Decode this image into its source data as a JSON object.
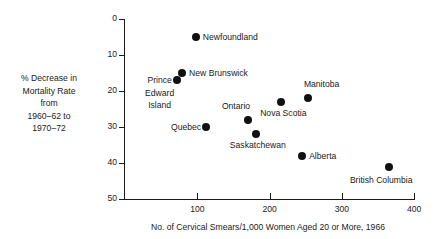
{
  "chart_data": {
    "type": "scatter",
    "title": "",
    "xlabel": "No. of Cervical Smears/1,000 Women Aged 20 or More, 1966",
    "ylabel": "% Decrease in\nMortality Rate\nfrom\n1960–62 to\n1970–72",
    "xlim": [
      0,
      400
    ],
    "ylim": [
      0,
      50
    ],
    "y_inverted": true,
    "grid": false,
    "legend": "none",
    "x_ticks": [
      100,
      200,
      300,
      400
    ],
    "y_ticks": [
      0,
      10,
      20,
      30,
      40,
      50
    ],
    "points": [
      {
        "label": "Newfoundland",
        "x": 98,
        "y": 5,
        "label_pos": "right"
      },
      {
        "label": "New Brunswick",
        "x": 79,
        "y": 15,
        "label_pos": "right"
      },
      {
        "label": "Prince\nEdward\nIsland",
        "x": 72,
        "y": 17,
        "label_pos": "left-below"
      },
      {
        "label": "Quebec",
        "x": 112,
        "y": 30,
        "label_pos": "left"
      },
      {
        "label": "Ontario",
        "x": 170,
        "y": 28,
        "label_pos": "above-left"
      },
      {
        "label": "Saskatchewan",
        "x": 181,
        "y": 32,
        "label_pos": "below"
      },
      {
        "label": "Nova Scotia",
        "x": 216,
        "y": 23,
        "label_pos": "below"
      },
      {
        "label": "Manitoba",
        "x": 253,
        "y": 22,
        "label_pos": "above"
      },
      {
        "label": "Alberta",
        "x": 245,
        "y": 38,
        "label_pos": "right"
      },
      {
        "label": "British Columbia",
        "x": 365,
        "y": 41,
        "label_pos": "below-left"
      }
    ]
  },
  "colors": {
    "ink": "#1a1a1a",
    "background": "#ffffff"
  }
}
